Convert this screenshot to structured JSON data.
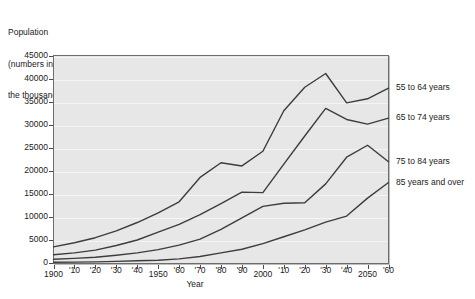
{
  "chart_data": {
    "type": "line",
    "title": "Population (numbers in the thousands)",
    "ylabel_lines": [
      "Population",
      "(numbers in",
      "the thousands)"
    ],
    "xlabel": "Year",
    "grid": true,
    "legend_position": "right-outside",
    "ylim": [
      0,
      45000
    ],
    "ytick_values": [
      0,
      5000,
      10000,
      15000,
      20000,
      25000,
      30000,
      35000,
      40000,
      45000
    ],
    "ytick_labels": [
      "0",
      "5000",
      "10000",
      "15000",
      "20000",
      "25000",
      "30000",
      "35000",
      "40000",
      "45000"
    ],
    "x": [
      1900,
      1910,
      1920,
      1930,
      1940,
      1950,
      1960,
      1970,
      1980,
      1990,
      2000,
      2010,
      2020,
      2030,
      2040,
      2050,
      2060
    ],
    "xtick_labels": [
      "1900",
      "'10",
      "'20",
      "'30",
      "'40",
      "1950",
      "'60",
      "'70",
      "'80",
      "'90",
      "2000",
      "'10",
      "'20",
      "'30",
      "'40",
      "2050",
      "'60"
    ],
    "series": [
      {
        "name": "55 to 64 years",
        "values": [
          3500,
          4400,
          5500,
          7000,
          8800,
          10900,
          13300,
          18600,
          21800,
          21100,
          24300,
          33100,
          38200,
          41200,
          34800,
          35700,
          38000
        ]
      },
      {
        "name": "65 to 74 years",
        "values": [
          1800,
          2200,
          2800,
          3800,
          5000,
          6700,
          8400,
          10500,
          12900,
          15400,
          15300,
          21500,
          27600,
          33600,
          31200,
          30200,
          31500
        ]
      },
      {
        "name": "75 to 84 years",
        "values": [
          800,
          1000,
          1250,
          1700,
          2200,
          2900,
          3900,
          5200,
          7300,
          9800,
          12300,
          13000,
          13100,
          17200,
          23000,
          25600,
          22000
        ]
      },
      {
        "name": "85 years and over",
        "values": [
          150,
          200,
          250,
          350,
          500,
          600,
          900,
          1400,
          2200,
          3000,
          4200,
          5700,
          7200,
          8900,
          10200,
          14100,
          17500
        ]
      }
    ],
    "colors": {
      "line": "#3d3d3d",
      "plot_background": "#e7e7e7",
      "grid": "#f4f4f4",
      "border": "#6d6d6d",
      "text": "#1a1a1a"
    }
  }
}
